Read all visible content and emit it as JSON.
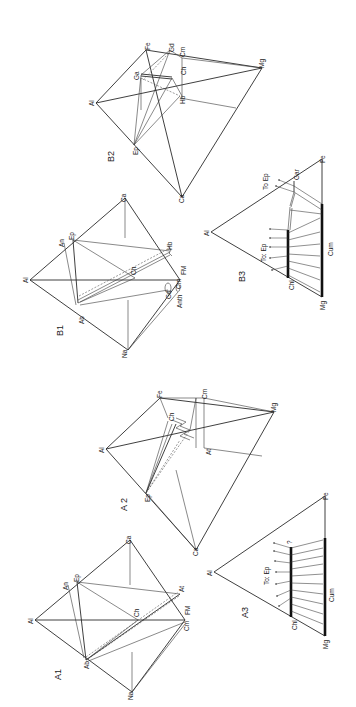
{
  "figure": {
    "orientation": "rotated 90 degrees counter-clockwise",
    "panels": {
      "A1": {
        "label": "A1",
        "vertices": {
          "Al": "Al",
          "Ca": "Ca",
          "Na": "Na",
          "Cm": "Cm",
          "FM": "FM",
          "An": "An",
          "Ep": "Ep",
          "Ab": "Ab",
          "Ch": "Ch",
          "At": "At"
        }
      },
      "A2": {
        "label": "A 2",
        "vertices": {
          "Al": "Al",
          "Ep": "Ep",
          "Fe": "Fe",
          "Cm": "Cm",
          "At": "At",
          "Ch": "Ch",
          "Ca": "Ca",
          "Mg": "Mg"
        }
      },
      "A3": {
        "label": "A3",
        "vertices": {
          "Al": "Al",
          "Fe": "Fe",
          "Mg": "Mg",
          "Chl": "Chl",
          "Cum": "Cum"
        },
        "annotations": {
          "to_ep": "To: Ep",
          "question": "?"
        }
      },
      "B1": {
        "label": "B1",
        "vertices": {
          "Al": "Al",
          "Ca": "Ca",
          "Na": "Na",
          "FM": "FM",
          "Cm": "Cm",
          "An": "An",
          "Ep": "Ep",
          "Ab": "Ab",
          "Ch": "Ch",
          "Hb": "Hb",
          "Gd": "Gd",
          "Anth": "Anth"
        }
      },
      "B2": {
        "label": "B2",
        "vertices": {
          "Al": "Al",
          "Ep": "Ep",
          "Fe": "Fe",
          "Gd": "Gd",
          "Cm": "Cm",
          "Ga": "Ga",
          "Ch": "Ch",
          "Hb": "Hb",
          "Ca": "Ca",
          "Mg": "Mg"
        }
      },
      "B3": {
        "label": "B3",
        "vertices": {
          "Al": "Al",
          "Fe": "Fe",
          "Mg": "Mg",
          "Chl": "Chl",
          "Cum": "Cum",
          "Gar": "Gar"
        },
        "annotations": {
          "to_ep_upper": "To  Ep",
          "to_ep_lower": "To: Ep"
        }
      }
    }
  }
}
